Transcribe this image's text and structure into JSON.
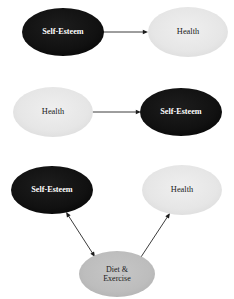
{
  "figure": {
    "background_color": "#ffffff",
    "panel_count": 3
  },
  "palette": {
    "node_black_fill": "#111111",
    "node_black_text": "#ffffff",
    "node_light_fill": "#e6e6e6",
    "node_light_text": "#1a1a1a",
    "node_medium_fill": "#bdbdbd",
    "node_medium_text": "#1a1a1a",
    "arrow_color": "#1d1d1d"
  },
  "labels": {
    "self_esteem": "Self-Esteem",
    "health": "Health",
    "diet_exercise_line1": "Diet &",
    "diet_exercise_line2": "Exercise",
    "diet_exercise_full": "Diet & Exercise"
  },
  "panels": [
    {
      "id": "panel-1",
      "name": "self-esteem-causes-health",
      "nodes": [
        {
          "id": "p1-self-esteem",
          "name": "self-esteem-node",
          "label": "Self-Esteem",
          "style": "black",
          "cx": 63,
          "cy": 32,
          "rx": 41,
          "ry": 24,
          "font_size": 8.2
        },
        {
          "id": "p1-health",
          "name": "health-node",
          "label": "Health",
          "style": "light",
          "cx": 188,
          "cy": 32,
          "rx": 40,
          "ry": 25,
          "font_size": 8.4
        }
      ],
      "edges": [
        {
          "id": "p1-edge",
          "name": "arrow-self-esteem-to-health",
          "from": "p1-self-esteem",
          "to": "p1-health",
          "x1": 93,
          "y1": 32,
          "x2": 148,
          "y2": 32,
          "heads": "forward",
          "direction": "left-to-right"
        }
      ]
    },
    {
      "id": "panel-2",
      "name": "health-causes-self-esteem",
      "nodes": [
        {
          "id": "p2-health",
          "name": "health-node",
          "label": "Health",
          "style": "light",
          "cx": 53,
          "cy": 112,
          "rx": 40,
          "ry": 25,
          "font_size": 8.4
        },
        {
          "id": "p2-self-esteem",
          "name": "self-esteem-node",
          "label": "Self-Esteem",
          "style": "black",
          "cx": 181,
          "cy": 112,
          "rx": 41,
          "ry": 24,
          "font_size": 8.2
        }
      ],
      "edges": [
        {
          "id": "p2-edge",
          "name": "arrow-health-to-self-esteem",
          "from": "p2-health",
          "to": "p2-self-esteem",
          "x1": 86,
          "y1": 112,
          "x2": 141,
          "y2": 112,
          "heads": "forward",
          "direction": "left-to-right"
        }
      ]
    },
    {
      "id": "panel-3",
      "name": "diet-exercise-mediator-model",
      "nodes": [
        {
          "id": "p3-self-esteem",
          "name": "self-esteem-node",
          "label": "Self-Esteem",
          "style": "black",
          "cx": 52,
          "cy": 190,
          "rx": 41,
          "ry": 24,
          "font_size": 8.2
        },
        {
          "id": "p3-health",
          "name": "health-node",
          "label": "Health",
          "style": "light",
          "cx": 182,
          "cy": 190,
          "rx": 40,
          "ry": 25,
          "font_size": 8.4
        },
        {
          "id": "p3-diet-exercise",
          "name": "diet-exercise-node",
          "label": "Diet & Exercise",
          "style": "medium",
          "cx": 117,
          "cy": 274,
          "rx": 38,
          "ry": 23,
          "font_size": 8.0,
          "two_line": true
        }
      ],
      "edges": [
        {
          "id": "p3-edge-left",
          "name": "arrow-self-esteem-diet-exercise-bidirectional",
          "from": "p3-diet-exercise",
          "to": "p3-self-esteem",
          "x1": 95,
          "y1": 257,
          "x2": 66,
          "y2": 212,
          "heads": "both",
          "direction": "bidirectional"
        },
        {
          "id": "p3-edge-right",
          "name": "arrow-diet-exercise-to-health",
          "from": "p3-diet-exercise",
          "to": "p3-health",
          "x1": 141,
          "y1": 257,
          "x2": 170,
          "y2": 213,
          "heads": "forward",
          "direction": "upward-right"
        }
      ]
    }
  ]
}
